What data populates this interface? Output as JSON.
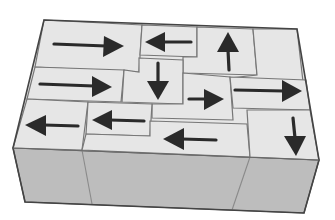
{
  "puzzle": {
    "type": "arrow-block-puzzle",
    "colors": {
      "top_face": "#e6e6e6",
      "front_face": "#bdbdbd",
      "grid_line": "#777777",
      "arrow": "#2a2a2a",
      "background": "#ffffff"
    },
    "blocks": [
      {
        "id": 1,
        "direction": "right"
      },
      {
        "id": 2,
        "direction": "left"
      },
      {
        "id": 3,
        "direction": "up"
      },
      {
        "id": 4,
        "direction": "none"
      },
      {
        "id": 5,
        "direction": "right"
      },
      {
        "id": 6,
        "direction": "down"
      },
      {
        "id": 7,
        "direction": "right"
      },
      {
        "id": 8,
        "direction": "right"
      },
      {
        "id": 9,
        "direction": "left"
      },
      {
        "id": 10,
        "direction": "left"
      },
      {
        "id": 11,
        "direction": "left"
      },
      {
        "id": 12,
        "direction": "down"
      }
    ],
    "block_count": 12,
    "arrow_icons": {
      "right": "arrow-right-icon",
      "left": "arrow-left-icon",
      "up": "arrow-up-icon",
      "down": "arrow-down-icon"
    }
  }
}
